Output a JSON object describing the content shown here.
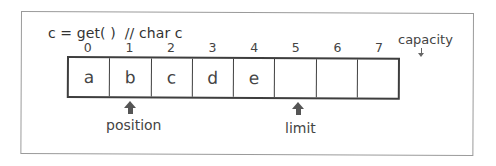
{
  "diagram": {
    "title": "c = get( )  // char c",
    "buffer": {
      "indexes": [
        "0",
        "1",
        "2",
        "3",
        "4",
        "5",
        "6",
        "7"
      ],
      "cells": [
        "a",
        "b",
        "c",
        "d",
        "e",
        "",
        "",
        ""
      ]
    },
    "markers": {
      "position": {
        "label": "position",
        "index": 1
      },
      "limit": {
        "label": "limit",
        "index": 5
      },
      "capacity": {
        "label": "capacity",
        "index": 8
      }
    },
    "colors": {
      "cell_border": "#3e3e3e",
      "frame_border": "#9a9a9a",
      "arrow": "#555555",
      "text": "#444444"
    }
  }
}
